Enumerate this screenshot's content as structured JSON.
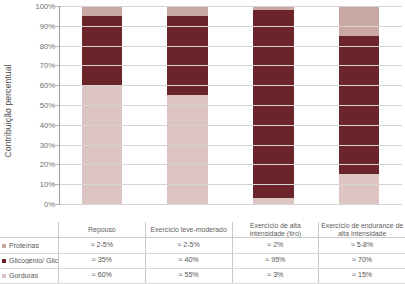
{
  "chart_data": {
    "type": "bar",
    "subtype": "100% stacked column",
    "title": "",
    "xlabel": "",
    "ylabel": "Contribuição percentual",
    "ylim": [
      0,
      100
    ],
    "ytick_labels": [
      "100%",
      "90%",
      "80%",
      "70%",
      "60%",
      "50%",
      "40%",
      "30%",
      "20%",
      "10%",
      "0%"
    ],
    "ytick_values": [
      100,
      90,
      80,
      70,
      60,
      50,
      40,
      30,
      20,
      10,
      0
    ],
    "grid": true,
    "legend_position": "table-left",
    "categories": [
      "Repouso",
      "Exercício leve-moderado",
      "Exercício de alta intensidade (tiro)",
      "Exercício de endurance de alta intensidade"
    ],
    "series": [
      {
        "name": "Gorduras",
        "color": "#dcc5c2",
        "values": [
          60,
          55,
          3,
          15
        ],
        "labels": [
          "≈ 60%",
          "≈ 55%",
          "≈ 3%",
          "≈ 15%"
        ]
      },
      {
        "name": "Glicogénio/ Glicose",
        "color": "#6b2429",
        "values": [
          35,
          40,
          95,
          70
        ],
        "labels": [
          "≈ 35%",
          "≈ 40%",
          "≈ 95%",
          "≈ 70%"
        ]
      },
      {
        "name": "Proteínas",
        "color": "#c9a8a4",
        "values": [
          5,
          5,
          2,
          15
        ],
        "labels": [
          "≈ 2-5%",
          "≈ 2-5%",
          "≈ 2%",
          "≈ 5-8%"
        ]
      }
    ]
  },
  "table": {
    "header_corner": "",
    "rows": [
      {
        "label": "Proteínas",
        "color": "#c9a8a4",
        "cells": [
          "≈ 2-5%",
          "≈ 2-5%",
          "≈ 2%",
          "≈ 5-8%"
        ]
      },
      {
        "label": "Glicogénio/ Glicose",
        "color": "#6b2429",
        "cells": [
          "≈ 35%",
          "≈ 40%",
          "≈ 95%",
          "≈ 70%"
        ]
      },
      {
        "label": "Gorduras",
        "color": "#dcc5c2",
        "cells": [
          "≈ 60%",
          "≈ 55%",
          "≈ 3%",
          "≈ 15%"
        ]
      }
    ]
  },
  "colors": {
    "proteinas": "#c9a8a4",
    "glicogenio": "#6b2429",
    "gorduras": "#dcc5c2",
    "grid": "#d4d4d4",
    "axis": "#9a9a9a",
    "text": "#5a5a5a"
  }
}
